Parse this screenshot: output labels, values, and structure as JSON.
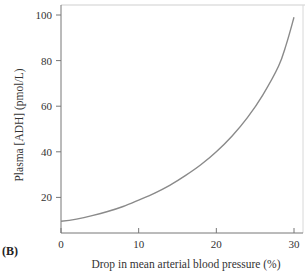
{
  "panel_label": "(B)",
  "chart_data": {
    "type": "line",
    "title": "",
    "xlabel": "Drop in mean arterial blood pressure (%)",
    "ylabel": "Plasma [ADH] (pmol/L)",
    "xlim": [
      0,
      30
    ],
    "ylim": [
      0,
      100
    ],
    "xticks": [
      0,
      10,
      20,
      30
    ],
    "yticks": [
      20,
      40,
      60,
      80,
      100
    ],
    "grid": false,
    "legend": null,
    "series": [
      {
        "name": "Plasma ADH",
        "color": "#8a8a8a",
        "x": [
          0,
          2,
          4,
          6,
          8,
          10,
          12,
          14,
          16,
          18,
          20,
          22,
          24,
          26,
          28,
          29,
          30
        ],
        "y": [
          9.5,
          10.5,
          12,
          13.8,
          16,
          18.8,
          21.8,
          25.3,
          29.5,
          34.3,
          40,
          46.8,
          55,
          65,
          77.5,
          87,
          99
        ]
      }
    ]
  }
}
